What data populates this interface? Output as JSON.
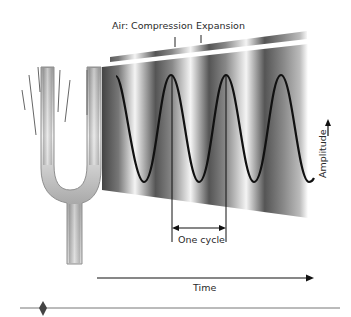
{
  "figure": {
    "labels": {
      "compression": "Air: Compression",
      "expansion": "Expansion",
      "amplitude": "Amplitude",
      "one_cycle": "One cycle",
      "time": "Time"
    },
    "colors": {
      "wave_line": "#111111",
      "field_dark": "#3a3a3a",
      "field_light": "#f2f2f2",
      "fork_metal": "#b8b8b8",
      "rule": "#777777",
      "marker": "#444444"
    },
    "wave": {
      "cycles_visible": 3.5,
      "period_px": 55,
      "peak_y": 75,
      "trough_y": 182
    }
  }
}
